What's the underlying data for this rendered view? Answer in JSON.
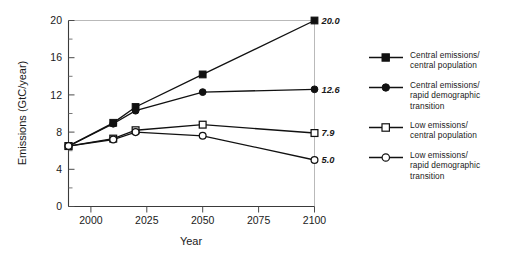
{
  "chart_data": {
    "type": "line",
    "title": "",
    "xlabel": "Year",
    "ylabel": "Emissions (GtC/year)",
    "xlim": [
      1990,
      2100
    ],
    "ylim": [
      0,
      20
    ],
    "xticks": [
      2000,
      2025,
      2050,
      2075,
      2100
    ],
    "xtick_labels": [
      "2000",
      "2025",
      "2050",
      "2075",
      "2100"
    ],
    "yticks": [
      0,
      4,
      8,
      12,
      16,
      20
    ],
    "ytick_labels": [
      "0",
      "4",
      "8",
      "12",
      "16",
      "20"
    ],
    "y_minor_ticks": [
      2,
      6,
      10,
      14,
      18
    ],
    "grid": false,
    "legend_position": "right",
    "x": [
      1990,
      2010,
      2020,
      2050,
      2100
    ],
    "series": [
      {
        "name": "Central emissions/\ncentral population",
        "marker": "filled-square",
        "values": [
          6.5,
          9.0,
          10.7,
          14.2,
          20.0
        ],
        "end_label": "20.0"
      },
      {
        "name": "Central emissions/\nrapid demographic\ntransition",
        "marker": "filled-circle",
        "values": [
          6.5,
          8.9,
          10.3,
          12.3,
          12.6
        ],
        "end_label": "12.6"
      },
      {
        "name": "Low emissions/\ncentral population",
        "marker": "open-square",
        "values": [
          6.5,
          7.3,
          8.2,
          8.8,
          7.9
        ],
        "end_label": "7.9"
      },
      {
        "name": "Low emissions/\nrapid demographic\ntransition",
        "marker": "open-circle",
        "values": [
          6.5,
          7.2,
          8.0,
          7.6,
          5.0
        ],
        "end_label": "5.0"
      }
    ]
  },
  "colors": {
    "line": "#111111",
    "axis": "#3a3a3a",
    "box": "#b9b9b9",
    "text": "#1a1a1a",
    "background": "#ffffff"
  },
  "legend": {
    "items": [
      {
        "label": "Central emissions/\ncentral population",
        "marker": "filled-square"
      },
      {
        "label": "Central emissions/\nrapid demographic\ntransition",
        "marker": "filled-circle"
      },
      {
        "label": "Low emissions/\ncentral population",
        "marker": "open-square"
      },
      {
        "label": "Low emissions/\nrapid demographic\ntransition",
        "marker": "open-circle"
      }
    ]
  }
}
